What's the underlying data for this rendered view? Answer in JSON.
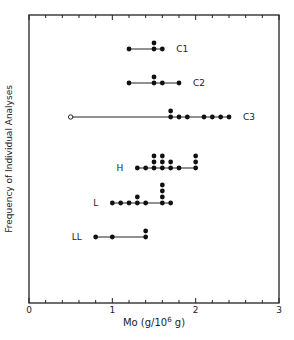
{
  "chart_data": {
    "type": "scatter",
    "subtype": "dot-strip-plot",
    "title": "",
    "xlabel": "Mo (g/10^6 g)",
    "xlabel_parts": {
      "main": "Mo (g/10",
      "sup": "6",
      "tail": " g)"
    },
    "ylabel": "Frequency of Individual Analyses",
    "xlim": [
      0,
      3
    ],
    "x_ticks_major": [
      0,
      1,
      2,
      3
    ],
    "x_tick_labels": [
      "0",
      "1",
      "2",
      "3"
    ],
    "x_tick_minor_step": 0.2,
    "grid": false,
    "legend": null,
    "series": [
      {
        "name": "C1",
        "points": [
          {
            "x": 1.2,
            "count": 1
          },
          {
            "x": 1.5,
            "count": 2
          },
          {
            "x": 1.6,
            "count": 1
          }
        ]
      },
      {
        "name": "C2",
        "points": [
          {
            "x": 1.2,
            "count": 1
          },
          {
            "x": 1.5,
            "count": 2
          },
          {
            "x": 1.6,
            "count": 1
          },
          {
            "x": 1.8,
            "count": 1
          }
        ]
      },
      {
        "name": "C3",
        "points": [
          {
            "x": 0.5,
            "count": 1,
            "open": true
          },
          {
            "x": 1.7,
            "count": 2
          },
          {
            "x": 1.8,
            "count": 1
          },
          {
            "x": 1.9,
            "count": 1
          },
          {
            "x": 2.1,
            "count": 1
          },
          {
            "x": 2.2,
            "count": 1
          },
          {
            "x": 2.3,
            "count": 1
          },
          {
            "x": 2.4,
            "count": 1
          }
        ]
      },
      {
        "name": "H",
        "points": [
          {
            "x": 1.3,
            "count": 1
          },
          {
            "x": 1.4,
            "count": 1
          },
          {
            "x": 1.5,
            "count": 3
          },
          {
            "x": 1.6,
            "count": 3
          },
          {
            "x": 1.7,
            "count": 2
          },
          {
            "x": 1.8,
            "count": 1
          },
          {
            "x": 2.0,
            "count": 3
          }
        ]
      },
      {
        "name": "L",
        "points": [
          {
            "x": 1.0,
            "count": 1
          },
          {
            "x": 1.1,
            "count": 1
          },
          {
            "x": 1.2,
            "count": 1
          },
          {
            "x": 1.3,
            "count": 2
          },
          {
            "x": 1.4,
            "count": 1
          },
          {
            "x": 1.6,
            "count": 4
          },
          {
            "x": 1.7,
            "count": 1
          }
        ]
      },
      {
        "name": "LL",
        "points": [
          {
            "x": 0.8,
            "count": 1
          },
          {
            "x": 1.0,
            "count": 1
          },
          {
            "x": 1.4,
            "count": 2
          }
        ]
      }
    ]
  },
  "layout": {
    "series_baseline_y": [
      49,
      83,
      117,
      168,
      203,
      237
    ],
    "series_label_side": [
      "right",
      "right",
      "right",
      "left",
      "left",
      "left"
    ]
  }
}
